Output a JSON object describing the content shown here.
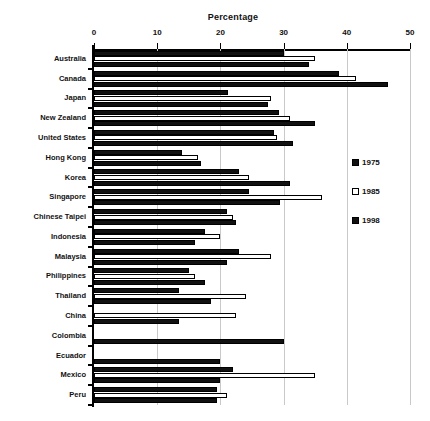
{
  "chart_data": {
    "type": "bar",
    "orientation": "horizontal",
    "title": "Percentage",
    "xlabel": "",
    "ylabel": "",
    "xlim": [
      0,
      50
    ],
    "xticks": [
      0,
      10,
      20,
      30,
      40,
      50
    ],
    "xtick_labels": [
      "0",
      "10",
      "20",
      "30",
      "40",
      "50"
    ],
    "grid": true,
    "grid_axis": "x",
    "legend_position": "right",
    "categories": [
      "Australia",
      "Canada",
      "Japan",
      "New Zealand",
      "United States",
      "Hong Kong",
      "Korea",
      "Singapore",
      "Chinese Taipei",
      "Indonesia",
      "Malaysia",
      "Philippines",
      "Thailand",
      "China",
      "Colombia",
      "Ecuador",
      "Mexico",
      "Peru"
    ],
    "series": [
      {
        "name": "1975",
        "style": "filled",
        "color": "#111111",
        "values": [
          30.0,
          38.8,
          21.2,
          29.2,
          28.5,
          14.0,
          23.0,
          24.5,
          21.0,
          17.5,
          23.0,
          15.0,
          13.5,
          0.0,
          0.0,
          0.0,
          22.0,
          19.5
        ]
      },
      {
        "name": "1985",
        "style": "open",
        "color": "#ffffff",
        "values": [
          35.0,
          41.5,
          28.0,
          31.0,
          29.0,
          16.5,
          24.5,
          36.0,
          22.0,
          20.0,
          28.0,
          16.0,
          24.0,
          22.5,
          0.0,
          0.0,
          35.0,
          21.0
        ]
      },
      {
        "name": "1998",
        "style": "filled",
        "color": "#111111",
        "values": [
          34.0,
          46.5,
          27.5,
          35.0,
          31.5,
          17.0,
          31.0,
          29.5,
          22.5,
          16.0,
          21.0,
          17.5,
          18.5,
          13.5,
          30.0,
          20.0,
          20.0,
          19.5
        ]
      }
    ]
  },
  "legend": {
    "items": [
      {
        "label": "1975",
        "style": "filled"
      },
      {
        "label": "1985",
        "style": "open"
      },
      {
        "label": "1998",
        "style": "filled"
      }
    ]
  }
}
